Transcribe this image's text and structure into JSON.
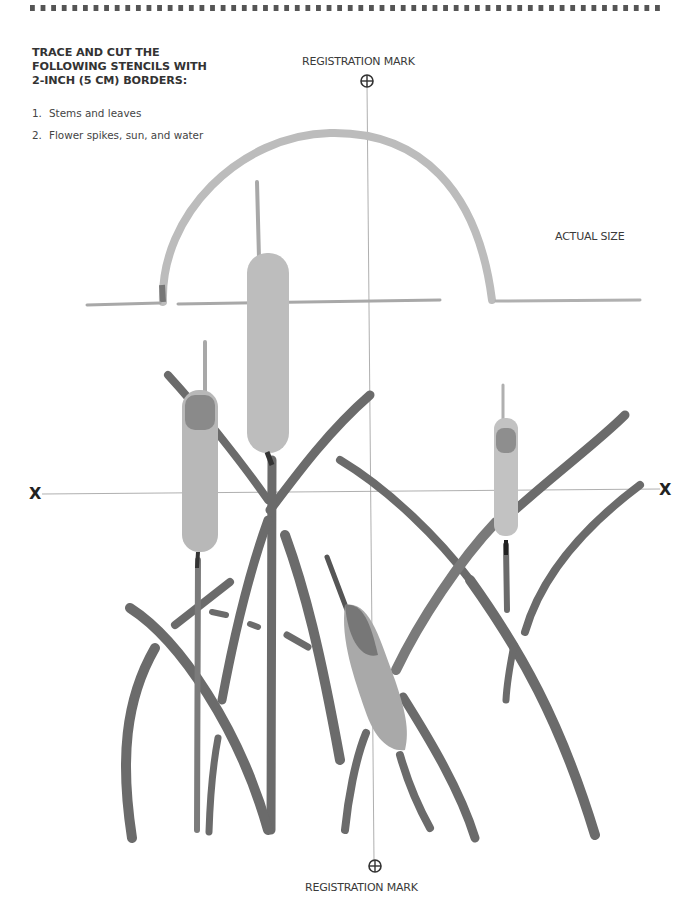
{
  "header": {
    "title_lines": [
      "TRACE AND CUT THE",
      "FOLLOWING STENCILS WITH",
      "2-INCH (5 CM) BORDERS:"
    ]
  },
  "instructions": [
    {
      "num": "1.",
      "text": "Stems and leaves"
    },
    {
      "num": "2.",
      "text": "Flower spikes, sun, and water"
    }
  ],
  "registration": {
    "top_label": "REGISTRATION MARK",
    "bottom_label": "REGISTRATION MARK",
    "icon": "crosshair-circle-icon"
  },
  "scale_label": "ACTUAL SIZE",
  "axis_marks": {
    "left": "X",
    "right": "X"
  },
  "illustration": {
    "subject": "Cattails stencil pattern",
    "elements": [
      "sun arc",
      "water line",
      "cattail flower spikes",
      "stems and leaves"
    ],
    "colors": {
      "leaf": "#6b6b6b",
      "spike": "#b9b9b9",
      "spike_dark": "#7a7a7a",
      "sun": "#bdbdbd",
      "guide_line": "#9a9a9a",
      "border": "#555555"
    }
  }
}
